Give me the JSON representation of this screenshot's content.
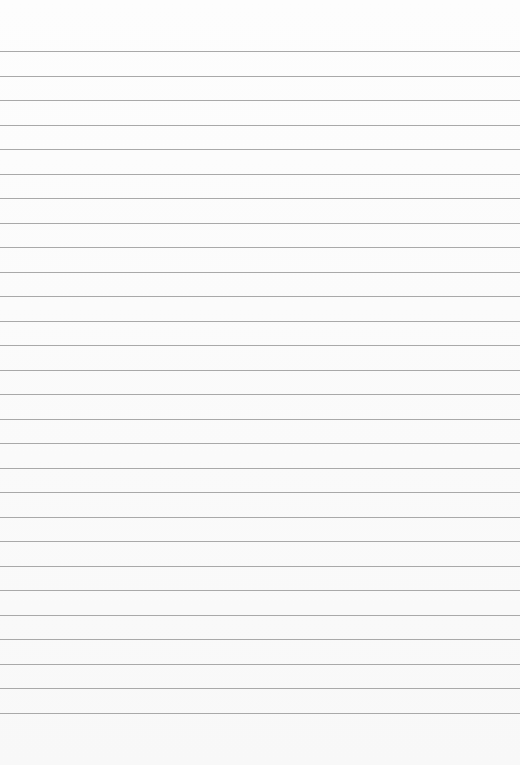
{
  "paper": {
    "type": "lined-paper",
    "background_color": "#fbfbfb",
    "line_color": "#a9a9a9",
    "line_count": 28,
    "first_line_y": 51,
    "line_spacing": 24.5
  }
}
